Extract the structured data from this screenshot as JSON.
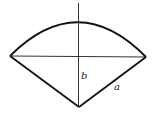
{
  "diagram": {
    "type": "circular-sector",
    "labels": {
      "vertical_segment": "b",
      "slant_side": "a"
    },
    "colors": {
      "stroke": "#111111",
      "axis": "#333333",
      "background": "#ffffff"
    }
  }
}
